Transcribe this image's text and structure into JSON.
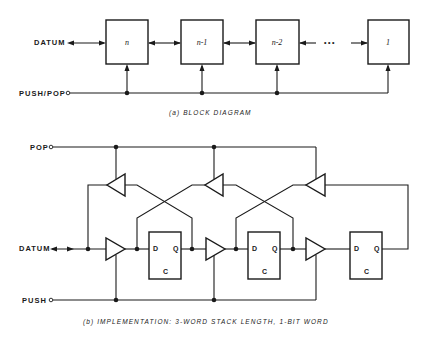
{
  "block_diagram": {
    "datum_label": "DATUM",
    "push_pop_label": "PUSH/POP",
    "blocks": [
      {
        "label": "n"
      },
      {
        "label": "n-1"
      },
      {
        "label": "n-2"
      },
      {
        "label": "1"
      }
    ],
    "ellipsis": "•••",
    "caption": "(a) BLOCK DIAGRAM"
  },
  "implementation": {
    "pop_label": "POP",
    "datum_label": "DATUM",
    "push_label": "PUSH",
    "flip_flops": [
      {
        "d": "D",
        "q": "Q",
        "c": "C"
      },
      {
        "d": "D",
        "q": "Q",
        "c": "C"
      },
      {
        "d": "D",
        "q": "Q",
        "c": "C"
      }
    ],
    "caption": "(b) IMPLEMENTATION: 3-WORD STACK LENGTH, 1-BIT WORD"
  }
}
